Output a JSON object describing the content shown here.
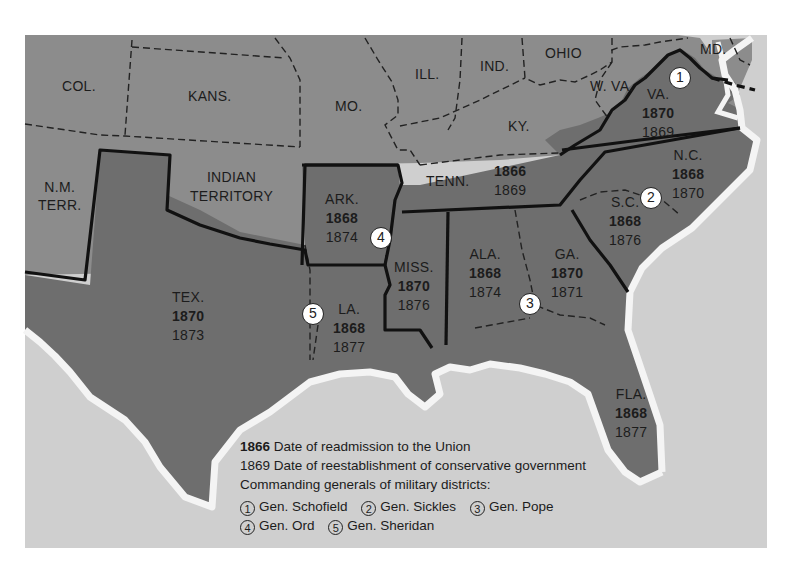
{
  "map": {
    "colors": {
      "water": "#cfcfcf",
      "union_states": "#8c8c8c",
      "confederate_states": "#6e6e6e",
      "coast_outline": "#f4f4f4",
      "boundary": "#111111",
      "page_background": "#ffffff"
    },
    "state_labels": [
      {
        "id": "col",
        "name": "COL."
      },
      {
        "id": "kans",
        "name": "KANS."
      },
      {
        "id": "mo",
        "name": "MO."
      },
      {
        "id": "ill",
        "name": "ILL."
      },
      {
        "id": "ind",
        "name": "IND."
      },
      {
        "id": "ohio",
        "name": "OHIO"
      },
      {
        "id": "md",
        "name": "MD."
      },
      {
        "id": "wva",
        "name": "W. VA."
      },
      {
        "id": "ky",
        "name": "KY."
      },
      {
        "id": "nm",
        "name": "N.M.",
        "name2": "TERR."
      },
      {
        "id": "indian",
        "name": "INDIAN",
        "name2": "TERRITORY"
      }
    ],
    "confederate_states": [
      {
        "id": "va",
        "name": "VA.",
        "readmission": "1870",
        "conservative": "1869"
      },
      {
        "id": "nc",
        "name": "N.C.",
        "readmission": "1868",
        "conservative": "1870"
      },
      {
        "id": "tenn",
        "name": "TENN.",
        "readmission": "1866",
        "conservative": "1869"
      },
      {
        "id": "sc",
        "name": "S.C.",
        "readmission": "1868",
        "conservative": "1876"
      },
      {
        "id": "ark",
        "name": "ARK.",
        "readmission": "1868",
        "conservative": "1874"
      },
      {
        "id": "ga",
        "name": "GA.",
        "readmission": "1870",
        "conservative": "1871"
      },
      {
        "id": "ala",
        "name": "ALA.",
        "readmission": "1868",
        "conservative": "1874"
      },
      {
        "id": "miss",
        "name": "MISS.",
        "readmission": "1870",
        "conservative": "1876"
      },
      {
        "id": "tex",
        "name": "TEX.",
        "readmission": "1870",
        "conservative": "1873"
      },
      {
        "id": "la",
        "name": "LA.",
        "readmission": "1868",
        "conservative": "1877"
      },
      {
        "id": "fla",
        "name": "FLA.",
        "readmission": "1868",
        "conservative": "1877"
      }
    ],
    "district_markers": [
      "1",
      "2",
      "3",
      "4",
      "5"
    ]
  },
  "legend": {
    "line1_bold": "1866",
    "line1_text": " Date of readmission to the Union",
    "line2": "1869 Date of reestablishment of conservative government",
    "line3": "Commanding generals of military districts:",
    "generals": [
      {
        "num": "1",
        "name": "Gen. Schofield"
      },
      {
        "num": "2",
        "name": "Gen. Sickles"
      },
      {
        "num": "3",
        "name": "Gen. Pope"
      },
      {
        "num": "4",
        "name": "Gen. Ord"
      },
      {
        "num": "5",
        "name": "Gen. Sheridan"
      }
    ]
  }
}
